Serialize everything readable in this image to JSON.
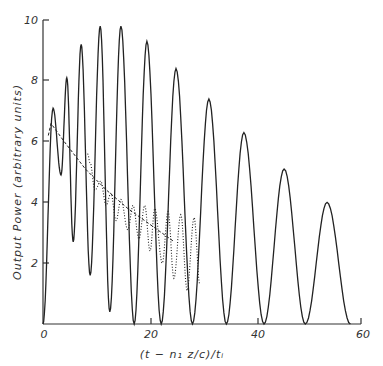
{
  "chart_data": {
    "type": "line",
    "title": "",
    "xlabel": "(t - n₁ z/c)/tᵢ",
    "ylabel": "Output Power (arbitrary units)",
    "xlim": [
      0,
      60
    ],
    "ylim": [
      0,
      10
    ],
    "grid": false,
    "legend": null,
    "x_ticks": [
      "0",
      "20",
      "40",
      "60"
    ],
    "y_ticks": [
      "2",
      "4",
      "6",
      "8",
      "10"
    ],
    "series": [
      {
        "name": "oscillating output (solid)",
        "style": "solid",
        "peaks": [
          {
            "x": 1.9,
            "y": 7.1
          },
          {
            "x": 4.5,
            "y": 8.1
          },
          {
            "x": 7.2,
            "y": 9.2
          },
          {
            "x": 10.8,
            "y": 9.8
          },
          {
            "x": 14.7,
            "y": 9.8
          },
          {
            "x": 19.6,
            "y": 9.3
          },
          {
            "x": 25.1,
            "y": 8.4
          },
          {
            "x": 31.3,
            "y": 7.4
          },
          {
            "x": 37.9,
            "y": 6.3
          },
          {
            "x": 45.5,
            "y": 5.1
          },
          {
            "x": 53.6,
            "y": 4.0
          }
        ],
        "minima": [
          {
            "x": 3.4,
            "y": 4.9
          },
          {
            "x": 5.7,
            "y": 2.7
          },
          {
            "x": 8.9,
            "y": 1.6
          },
          {
            "x": 12.6,
            "y": 0.4
          },
          {
            "x": 17.2,
            "y": 0.0
          },
          {
            "x": 22.3,
            "y": 0.0
          },
          {
            "x": 28.2,
            "y": 0.0
          },
          {
            "x": 34.6,
            "y": 0.0
          },
          {
            "x": 41.7,
            "y": 0.0
          },
          {
            "x": 49.5,
            "y": 0.0
          }
        ]
      },
      {
        "name": "averaged output (dashed)",
        "style": "dashed",
        "points": [
          {
            "x": 1.0,
            "y": 6.2
          },
          {
            "x": 1.5,
            "y": 6.6
          },
          {
            "x": 4.0,
            "y": 6.0
          },
          {
            "x": 8.0,
            "y": 5.1
          },
          {
            "x": 12.0,
            "y": 4.4
          },
          {
            "x": 16.0,
            "y": 3.8
          },
          {
            "x": 20.0,
            "y": 3.3
          },
          {
            "x": 24.8,
            "y": 2.7
          }
        ]
      },
      {
        "name": "oscillating output (dotted)",
        "style": "dotted",
        "peaks": [
          {
            "x": 8.9,
            "y": 5.3
          },
          {
            "x": 10.9,
            "y": 4.7
          },
          {
            "x": 12.8,
            "y": 4.3
          },
          {
            "x": 14.7,
            "y": 4.1
          },
          {
            "x": 17.0,
            "y": 3.9
          },
          {
            "x": 19.2,
            "y": 3.9
          },
          {
            "x": 21.1,
            "y": 3.8
          },
          {
            "x": 23.6,
            "y": 3.7
          },
          {
            "x": 26.0,
            "y": 3.6
          },
          {
            "x": 28.5,
            "y": 3.5
          }
        ],
        "minima": [
          {
            "x": 9.8,
            "y": 4.4
          },
          {
            "x": 11.9,
            "y": 3.9
          },
          {
            "x": 13.8,
            "y": 3.4
          },
          {
            "x": 16.0,
            "y": 3.1
          },
          {
            "x": 18.1,
            "y": 2.8
          },
          {
            "x": 20.2,
            "y": 2.4
          },
          {
            "x": 22.5,
            "y": 2.0
          },
          {
            "x": 24.7,
            "y": 1.5
          },
          {
            "x": 27.2,
            "y": 1.1
          },
          {
            "x": 29.6,
            "y": 1.3
          }
        ]
      }
    ]
  },
  "axes": {
    "x_label": "(t − n₁ z/c)/tᵢ",
    "y_label": "Output Power (arbitrary units)",
    "x_tick_labels": [
      "0",
      "20",
      "40",
      "60"
    ],
    "y_tick_labels": [
      "2",
      "4",
      "6",
      "8",
      "10"
    ]
  }
}
